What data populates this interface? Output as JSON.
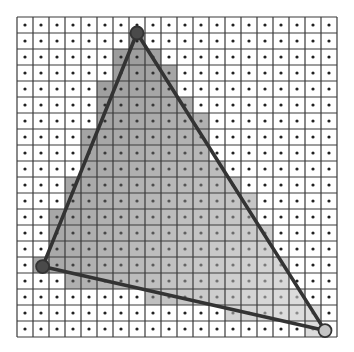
{
  "figure": {
    "grid": {
      "columns": 20,
      "rows": 20
    },
    "colors": {
      "background": "#ffffff",
      "grid_line": "#3a3a3a",
      "sample_dot": "#222222",
      "edge": "#333333",
      "vertex_dark": "#4a4a4a",
      "vertex_light": "#c4c4c4",
      "shade_dark": "#9a9a9a",
      "shade_light": "#dcdcdc"
    },
    "triangle": {
      "vertices": [
        {
          "name": "top",
          "col": 7.5,
          "row": 1.0,
          "shade": "dark"
        },
        {
          "name": "left",
          "col": 1.6,
          "row": 15.6,
          "shade": "dark"
        },
        {
          "name": "bottom-right",
          "col": 19.25,
          "row": 19.6,
          "shade": "light"
        }
      ]
    },
    "covered_pixels": [
      {
        "row": 1,
        "from": 7,
        "to": 7
      },
      {
        "row": 2,
        "from": 6,
        "to": 8
      },
      {
        "row": 3,
        "from": 6,
        "to": 9
      },
      {
        "row": 4,
        "from": 5,
        "to": 9
      },
      {
        "row": 5,
        "from": 5,
        "to": 10
      },
      {
        "row": 6,
        "from": 5,
        "to": 11
      },
      {
        "row": 7,
        "from": 4,
        "to": 11
      },
      {
        "row": 8,
        "from": 4,
        "to": 11
      },
      {
        "row": 9,
        "from": 4,
        "to": 12
      },
      {
        "row": 10,
        "from": 3,
        "to": 13
      },
      {
        "row": 11,
        "from": 3,
        "to": 14
      },
      {
        "row": 12,
        "from": 2,
        "to": 14
      },
      {
        "row": 13,
        "from": 2,
        "to": 15
      },
      {
        "row": 14,
        "from": 2,
        "to": 15
      },
      {
        "row": 15,
        "from": 1,
        "to": 16
      },
      {
        "row": 16,
        "from": 3,
        "to": 16
      },
      {
        "row": 17,
        "from": 8,
        "to": 17
      },
      {
        "row": 18,
        "from": 13,
        "to": 18
      },
      {
        "row": 19,
        "from": 18,
        "to": 18
      }
    ]
  }
}
